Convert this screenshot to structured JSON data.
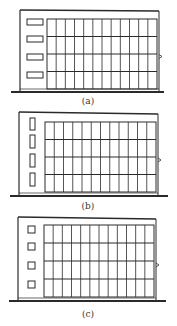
{
  "figures": [
    {
      "id": "a",
      "label": "(a)",
      "window_style": "horizontal-slot",
      "wall": {
        "x": 20,
        "top": 10,
        "right": 159,
        "roof_y": 11
      },
      "ground": {
        "y": 92,
        "x1": 11,
        "x2": 164
      },
      "grid": {
        "x": 47,
        "y": 19,
        "w": 110,
        "h": 70,
        "cols": 12,
        "rows": 4
      },
      "windows": [
        {
          "x": 27,
          "y": 19,
          "w": 16,
          "h": 6
        },
        {
          "x": 27,
          "y": 36,
          "w": 16,
          "h": 6
        },
        {
          "x": 27,
          "y": 54,
          "w": 16,
          "h": 6
        },
        {
          "x": 27,
          "y": 72,
          "w": 16,
          "h": 6
        }
      ],
      "label_pos": {
        "x": 88,
        "y": 104
      }
    },
    {
      "id": "b",
      "label": "(b)",
      "window_style": "vertical-slot",
      "wall": {
        "x": 19,
        "top": 112,
        "right": 158,
        "roof_y": 114
      },
      "ground": {
        "y": 196,
        "x1": 10,
        "x2": 168
      },
      "grid": {
        "x": 45,
        "y": 122,
        "w": 111,
        "h": 70,
        "cols": 12,
        "rows": 4
      },
      "windows": [
        {
          "x": 30,
          "y": 118,
          "w": 5,
          "h": 12
        },
        {
          "x": 30,
          "y": 135,
          "w": 5,
          "h": 13
        },
        {
          "x": 30,
          "y": 154,
          "w": 5,
          "h": 13
        },
        {
          "x": 30,
          "y": 173,
          "w": 5,
          "h": 13
        }
      ],
      "label_pos": {
        "x": 88,
        "y": 209
      }
    },
    {
      "id": "c",
      "label": "(c)",
      "window_style": "square",
      "wall": {
        "x": 18,
        "top": 217,
        "right": 156,
        "roof_y": 219
      },
      "ground": {
        "y": 301,
        "x1": 9,
        "x2": 166
      },
      "grid": {
        "x": 44,
        "y": 225,
        "w": 110,
        "h": 72,
        "cols": 12,
        "rows": 4
      },
      "windows": [
        {
          "x": 28,
          "y": 226,
          "w": 7,
          "h": 7
        },
        {
          "x": 28,
          "y": 243,
          "w": 7,
          "h": 7
        },
        {
          "x": 28,
          "y": 262,
          "w": 7,
          "h": 7
        },
        {
          "x": 28,
          "y": 281,
          "w": 7,
          "h": 7
        }
      ],
      "label_pos": {
        "x": 88,
        "y": 317
      }
    }
  ],
  "colors": {
    "line": "#2a2a2a",
    "background": "#ffffff",
    "label": "#333333"
  }
}
